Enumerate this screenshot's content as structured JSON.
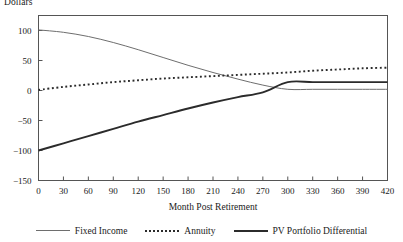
{
  "chart_data": {
    "type": "line",
    "title": "",
    "xlabel": "Month Post Retirement",
    "ylabel": "Dollars",
    "xlim": [
      0,
      420
    ],
    "ylim": [
      -150,
      125
    ],
    "xticks": [
      0,
      30,
      60,
      90,
      120,
      150,
      180,
      210,
      240,
      270,
      300,
      330,
      360,
      390,
      420
    ],
    "yticks": [
      100,
      50,
      0,
      -50,
      -100,
      -150
    ],
    "xtick_labels": [
      "0",
      "30",
      "60",
      "90",
      "120",
      "150",
      "180",
      "210",
      "240",
      "270",
      "300",
      "330",
      "360",
      "390",
      "420"
    ],
    "ytick_labels": [
      "100",
      "50",
      "0",
      "−50",
      "−100",
      "−150"
    ],
    "grid": false,
    "legend_position": "bottom",
    "x": [
      0,
      30,
      60,
      90,
      120,
      150,
      180,
      210,
      240,
      270,
      300,
      330,
      360,
      390,
      420
    ],
    "series": [
      {
        "name": "Fixed Income",
        "style": "solid-thin",
        "color": "#6e6e6e",
        "values": [
          101,
          97,
          90,
          80,
          68,
          55,
          42,
          30,
          19,
          9,
          2,
          2,
          2,
          2,
          2
        ]
      },
      {
        "name": "Annuity",
        "style": "dotted",
        "color": "#2b2b2b",
        "values": [
          1,
          6,
          10,
          14,
          17,
          20,
          22,
          24,
          26,
          28,
          30,
          33,
          35,
          37,
          38
        ]
      },
      {
        "name": "PV Portfolio Differential",
        "style": "solid-thick",
        "color": "#2b2b2b",
        "values": [
          -100,
          -88,
          -76,
          -64,
          -52,
          -41,
          -30,
          -20,
          -11,
          -3,
          14,
          14,
          14,
          14,
          14
        ]
      }
    ]
  },
  "legend": {
    "items": [
      {
        "label": "Fixed Income"
      },
      {
        "label": "Annuity"
      },
      {
        "label": "PV Portfolio Differential"
      }
    ]
  },
  "colors": {
    "fixed_income": "#6e6e6e",
    "annuity": "#2b2b2b",
    "pv_differential": "#2b2b2b",
    "axis": "#555555",
    "text": "#1a1a1a"
  }
}
